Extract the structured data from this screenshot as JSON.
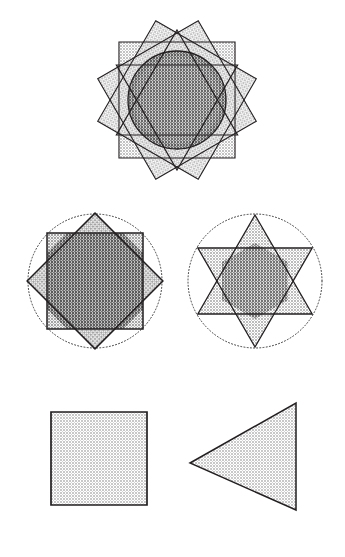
{
  "page": {
    "background_color": "#ffffff",
    "width": 345,
    "height": 557
  },
  "palette": {
    "stroke": "#231f20",
    "dotted_stroke": "#3a3a3a",
    "tone_light": "#d8d8d8",
    "tone_mid": "#bdbdbd",
    "tone_dark": "#9a9a9a",
    "tone_darker": "#7e7e7e",
    "paper": "#ffffff"
  },
  "figures": [
    {
      "id": "twelve-point-star",
      "name": "Twelve Pointed Star with Inscribed Circle",
      "row": 1,
      "column": "center",
      "center": {
        "x": 177,
        "y": 100
      },
      "outer_radius": 70,
      "inner_radius": 41,
      "points": 12,
      "components": [
        {
          "type": "square",
          "rotation_deg": 0
        },
        {
          "type": "square",
          "rotation_deg": 30
        },
        {
          "type": "square",
          "rotation_deg": 60
        },
        {
          "type": "triangle",
          "rotation_deg": 0
        },
        {
          "type": "triangle",
          "rotation_deg": 180
        },
        {
          "type": "circle",
          "radius": 49
        }
      ],
      "fill_tone": "#9a9a9a",
      "halo_tone": "#c9c9c9",
      "stroke_width": 1.1
    },
    {
      "id": "eight-point-star",
      "name": "Eight Pointed Star of Two Squares in Dotted Circle",
      "row": 2,
      "column": "left",
      "center": {
        "x": 95,
        "y": 281
      },
      "circle_radius": 67,
      "square_half_side": 48,
      "points": 8,
      "components": [
        {
          "type": "dotted-circle",
          "radius": 67
        },
        {
          "type": "square",
          "rotation_deg": 0
        },
        {
          "type": "square",
          "rotation_deg": 45
        }
      ],
      "fill_tone": "#bdbdbd",
      "core_tone": "#9a9a9a",
      "stroke_width": 1.4
    },
    {
      "id": "six-point-star",
      "name": "Star of David Hexagram in Dotted Circle",
      "row": 2,
      "column": "right",
      "center": {
        "x": 255,
        "y": 281
      },
      "circle_radius": 67,
      "triangle_radius": 66,
      "points": 6,
      "components": [
        {
          "type": "dotted-circle",
          "radius": 67
        },
        {
          "type": "triangle",
          "rotation_deg": 0
        },
        {
          "type": "triangle",
          "rotation_deg": 180
        }
      ],
      "fill_tone": "#cccccc",
      "core_tone": "#a0a0a0",
      "stroke_width": 1.2
    },
    {
      "id": "plain-square",
      "name": "Plain Shaded Square",
      "row": 3,
      "column": "left",
      "bounds": {
        "x": 51,
        "y": 412,
        "width": 96,
        "height": 93
      },
      "fill_tone": "#d6d6d6",
      "stroke_width": 1.6
    },
    {
      "id": "plain-triangle",
      "name": "Plain Shaded Left Pointing Triangle",
      "row": 3,
      "column": "right",
      "vertices": [
        {
          "x": 190,
          "y": 463
        },
        {
          "x": 296,
          "y": 403
        },
        {
          "x": 296,
          "y": 510
        }
      ],
      "fill_tone": "#d6d6d6",
      "stroke_width": 1.4
    }
  ]
}
